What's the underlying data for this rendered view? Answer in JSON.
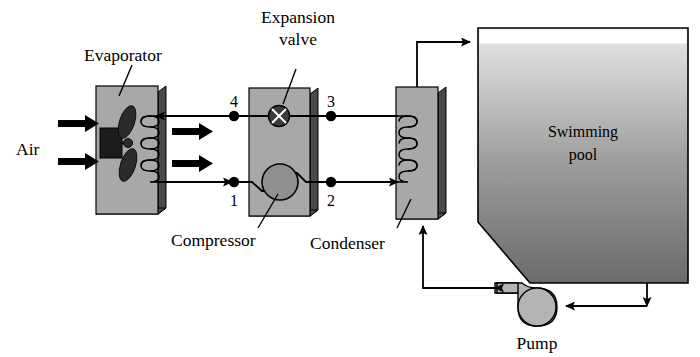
{
  "diagram": {
    "labels": {
      "evaporator": "Evaporator",
      "expansion_valve_line1": "Expansion",
      "expansion_valve_line2": "valve",
      "compressor": "Compressor",
      "condenser": "Condenser",
      "air": "Air",
      "pump": "Pump",
      "pool_line1": "Swimming",
      "pool_line2": "pool"
    },
    "state_points": [
      {
        "id": "1",
        "label": "1"
      },
      {
        "id": "2",
        "label": "2"
      },
      {
        "id": "3",
        "label": "3"
      },
      {
        "id": "4",
        "label": "4"
      }
    ],
    "colors": {
      "outline": "#000000",
      "panel_fill": "#a8a8a8",
      "panel_edge": "#555555",
      "component_fill": "#8f8f8f",
      "motor_fill": "#1c1c1c",
      "fan_fill": "#2b2b2b",
      "pool_top": "#d9d9d9",
      "pool_bottom": "#6e6e6e",
      "pump_fill": "#b4b4b4",
      "background": "#ffffff"
    }
  }
}
